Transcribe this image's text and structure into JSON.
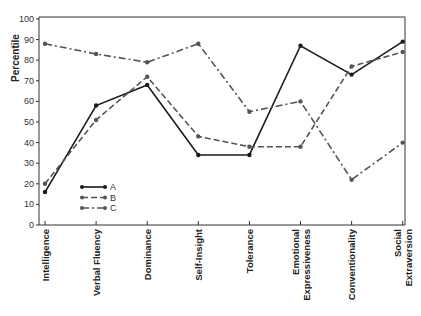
{
  "chart_data": {
    "type": "line",
    "title": "",
    "xlabel": "",
    "ylabel": "Percentile",
    "ylim": [
      0,
      100
    ],
    "yticks": [
      0,
      10,
      20,
      30,
      40,
      50,
      60,
      70,
      80,
      90,
      100
    ],
    "grid": false,
    "legend_position": "lower-left inside",
    "categories": [
      "Intelligence",
      "Verbal Fluency",
      "Dominance",
      "Self-Insight",
      "Tolerance",
      "Emotional Expressiveness",
      "Conventionality",
      "Social Extraversion"
    ],
    "category_lines": [
      [
        "Intelligence"
      ],
      [
        "Verbal Fluency"
      ],
      [
        "Dominance"
      ],
      [
        "Self-Insight"
      ],
      [
        "Tolerance"
      ],
      [
        "Emotional",
        "Expressiveness"
      ],
      [
        "Conventionality"
      ],
      [
        "Social",
        "Extraversion"
      ]
    ],
    "series": [
      {
        "name": "A",
        "style": "solid",
        "color": "#1a1a1a",
        "values": [
          16,
          58,
          68,
          34,
          34,
          87,
          73,
          89
        ]
      },
      {
        "name": "B",
        "style": "dashed",
        "color": "#555555",
        "values": [
          20,
          51,
          72,
          43,
          38,
          38,
          77,
          84
        ]
      },
      {
        "name": "C",
        "style": "dashdot",
        "color": "#555555",
        "values": [
          88,
          83,
          79,
          88,
          55,
          60,
          22,
          40
        ]
      }
    ]
  }
}
